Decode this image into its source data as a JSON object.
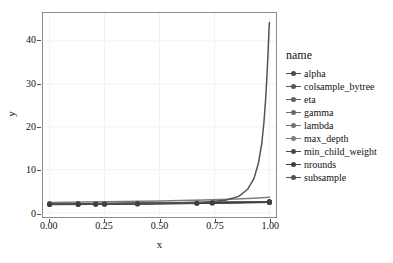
{
  "chart_data": {
    "type": "line",
    "title": "",
    "xlabel": "x",
    "ylabel": "y",
    "xlim": [
      -0.03,
      1.03
    ],
    "ylim": [
      -1.0,
      46.5
    ],
    "grid": true,
    "grid_color": "#f2f2f2",
    "panel_background": "#ffffff",
    "panel_border_color": "#8c8c8c",
    "legend": {
      "title": "name",
      "position": "right",
      "marker": "point-with-line"
    },
    "xticks": [
      {
        "value": 0.0,
        "label": "0.00"
      },
      {
        "value": 0.25,
        "label": "0.25"
      },
      {
        "value": 0.5,
        "label": "0.50"
      },
      {
        "value": 0.75,
        "label": "0.75"
      },
      {
        "value": 1.0,
        "label": "1.00"
      }
    ],
    "yticks": [
      {
        "value": 0,
        "label": "0"
      },
      {
        "value": 10,
        "label": "10"
      },
      {
        "value": 20,
        "label": "20"
      },
      {
        "value": 30,
        "label": "30"
      },
      {
        "value": 40,
        "label": "40"
      }
    ],
    "series": [
      {
        "name": "alpha",
        "color": "#4b4b4b",
        "points": [
          {
            "x": 0.0,
            "y": 2.05
          },
          {
            "x": 0.13,
            "y": 2.1
          },
          {
            "x": 0.25,
            "y": 2.15
          },
          {
            "x": 0.4,
            "y": 2.2
          },
          {
            "x": 0.55,
            "y": 2.3
          },
          {
            "x": 0.7,
            "y": 2.38
          },
          {
            "x": 0.85,
            "y": 2.45
          },
          {
            "x": 1.0,
            "y": 2.5
          }
        ],
        "markers_at": [
          0.0,
          0.13,
          1.0
        ]
      },
      {
        "name": "colsample_bytree",
        "color": "#565656",
        "points": [
          {
            "x": 0.0,
            "y": 2.0
          },
          {
            "x": 0.2,
            "y": 2.08
          },
          {
            "x": 0.4,
            "y": 2.18
          },
          {
            "x": 0.6,
            "y": 2.3
          },
          {
            "x": 0.8,
            "y": 2.42
          },
          {
            "x": 1.0,
            "y": 2.55
          }
        ],
        "markers_at": [
          0.21,
          0.4,
          1.0
        ]
      },
      {
        "name": "eta",
        "color": "#5f5f5f",
        "points": [
          {
            "x": 0.0,
            "y": 2.0
          },
          {
            "x": 0.25,
            "y": 2.1
          },
          {
            "x": 0.5,
            "y": 2.22
          },
          {
            "x": 0.75,
            "y": 2.35
          },
          {
            "x": 1.0,
            "y": 2.48
          }
        ],
        "markers_at": [
          0.25,
          0.74,
          1.0
        ]
      },
      {
        "name": "gamma",
        "color": "#6a6a6a",
        "points": [
          {
            "x": 0.0,
            "y": 1.95
          },
          {
            "x": 0.3,
            "y": 2.05
          },
          {
            "x": 0.6,
            "y": 2.2
          },
          {
            "x": 0.9,
            "y": 2.42
          },
          {
            "x": 1.0,
            "y": 2.5
          }
        ],
        "markers_at": [
          0.67,
          1.0
        ]
      },
      {
        "name": "lambda",
        "color": "#737373",
        "points": [
          {
            "x": 0.0,
            "y": 2.02
          },
          {
            "x": 0.35,
            "y": 2.12
          },
          {
            "x": 0.7,
            "y": 2.28
          },
          {
            "x": 1.0,
            "y": 2.45
          }
        ],
        "markers_at": [
          0.0,
          1.0
        ]
      },
      {
        "name": "max_depth",
        "color": "#7d7d7d",
        "points": [
          {
            "x": 0.0,
            "y": 2.4
          },
          {
            "x": 0.25,
            "y": 2.55
          },
          {
            "x": 0.5,
            "y": 2.75
          },
          {
            "x": 0.7,
            "y": 2.95
          },
          {
            "x": 0.85,
            "y": 3.2
          },
          {
            "x": 0.95,
            "y": 3.45
          },
          {
            "x": 1.0,
            "y": 3.6
          }
        ],
        "markers_at": []
      },
      {
        "name": "min_child_weight",
        "color": "#4a4a4a",
        "points": [
          {
            "x": 0.0,
            "y": 2.0
          },
          {
            "x": 0.3,
            "y": 2.1
          },
          {
            "x": 0.6,
            "y": 2.25
          },
          {
            "x": 0.85,
            "y": 2.4
          },
          {
            "x": 1.0,
            "y": 2.52
          }
        ],
        "markers_at": [
          0.0,
          1.0
        ]
      },
      {
        "name": "nrounds",
        "color": "#3f3f3f",
        "points": [
          {
            "x": 0.0,
            "y": 1.9
          },
          {
            "x": 0.2,
            "y": 1.95
          },
          {
            "x": 0.45,
            "y": 2.05
          },
          {
            "x": 0.7,
            "y": 2.22
          },
          {
            "x": 1.0,
            "y": 2.45
          }
        ],
        "markers_at": [
          0.0,
          0.13,
          0.21,
          0.25,
          0.4,
          0.67,
          0.74,
          1.0
        ]
      },
      {
        "name": "subsample",
        "color": "#525252",
        "points": [
          {
            "x": 0.0,
            "y": 2.05
          },
          {
            "x": 0.2,
            "y": 2.08
          },
          {
            "x": 0.4,
            "y": 2.15
          },
          {
            "x": 0.55,
            "y": 2.25
          },
          {
            "x": 0.7,
            "y": 2.45
          },
          {
            "x": 0.8,
            "y": 2.9
          },
          {
            "x": 0.86,
            "y": 3.8
          },
          {
            "x": 0.9,
            "y": 5.4
          },
          {
            "x": 0.93,
            "y": 8.0
          },
          {
            "x": 0.95,
            "y": 11.5
          },
          {
            "x": 0.965,
            "y": 16.0
          },
          {
            "x": 0.975,
            "y": 21.0
          },
          {
            "x": 0.983,
            "y": 26.5
          },
          {
            "x": 0.989,
            "y": 32.0
          },
          {
            "x": 0.994,
            "y": 37.5
          },
          {
            "x": 0.998,
            "y": 42.5
          },
          {
            "x": 1.0,
            "y": 44.3
          }
        ],
        "markers_at": []
      }
    ]
  }
}
